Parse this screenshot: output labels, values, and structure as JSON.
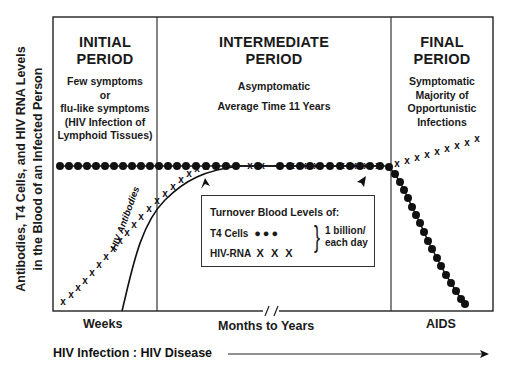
{
  "diagram": {
    "y_axis_label": {
      "line1": "Antibodies, T4 Cells, and HIV RNA Levels",
      "line2": "in the Blood of an Infected Person"
    },
    "periods": [
      {
        "title_line1": "INITIAL",
        "title_line2": "PERIOD",
        "description": [
          "Few symptoms",
          "or",
          "flu-like symptoms",
          "(HIV Infection of",
          "Lymphoid Tissues)"
        ]
      },
      {
        "title_line1": "INTERMEDIATE",
        "title_line2": "PERIOD",
        "description": [
          "Asymptomatic",
          "",
          "Average Time 11 Years"
        ]
      },
      {
        "title_line1": "FINAL",
        "title_line2": "PERIOD",
        "description": [
          "Symptomatic",
          "Majority of",
          "Opportunistic",
          "Infections"
        ]
      }
    ],
    "curve_labels": {
      "antibodies": "HIV Antibodies"
    },
    "legend": {
      "header": "Turnover  Blood Levels of:",
      "t4_label": "T4 Cells",
      "t4_symbol": "●●●",
      "hiv_label": "HIV-RNA",
      "hiv_symbol": "X X X",
      "brace": "}",
      "note_line1": "1 billion/",
      "note_line2": "each day"
    },
    "x_labels": {
      "weeks": "Weeks",
      "months": "Months to Years",
      "aids": "AIDS"
    },
    "x_axis_title": "HIV Infection : HIV Disease",
    "series": {
      "t4_cells": {
        "marker": "filled-circle",
        "trend": "flat high through initial and intermediate, falls steeply in final period"
      },
      "hiv_rna": {
        "marker": "x",
        "trend": "rises through initial period, flat in intermediate, rises again in final period"
      },
      "hiv_antibodies": {
        "marker": "line",
        "trend": "rises from weeks onward, plateaus in intermediate period"
      }
    },
    "colors": {
      "ink": "#111111",
      "background": "#ffffff"
    }
  }
}
